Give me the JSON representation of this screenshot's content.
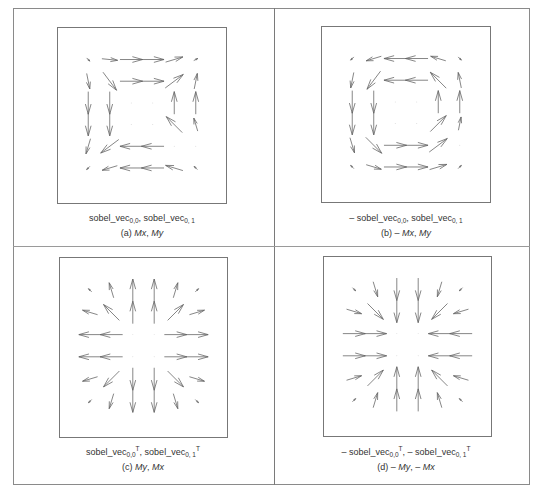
{
  "figure": {
    "panels": [
      {
        "id": "a",
        "box": {
          "left": 57,
          "top": 27,
          "width": 170,
          "height": 177
        },
        "caption": {
          "prefix": "",
          "term1": "sobel_vec",
          "term1_sub": "0,0",
          "term1_sup": "",
          "sep": ", ",
          "term2_prefix": "",
          "term2": "sobel_vec",
          "term2_sub": "0, 1",
          "term2_sup": ""
        },
        "caption_top": 212,
        "label": {
          "tag": "(a)",
          "pre1": "",
          "v1": "Mx",
          "sep": ", ",
          "pre2": "",
          "v2": "My"
        },
        "label_top": 228,
        "center_x": 142,
        "vectors": [
          [
            [
              1,
              1,
              0.2
            ],
            [
              1,
              0.1,
              0.7
            ],
            [
              1,
              0,
              1
            ],
            [
              1,
              0,
              1
            ],
            [
              1,
              -0.3,
              0.8
            ],
            [
              1,
              -0.5,
              0.2
            ]
          ],
          [
            [
              0.2,
              1,
              0.7
            ],
            [
              0.6,
              0.8,
              1
            ],
            [
              1,
              0,
              1
            ],
            [
              1,
              0,
              1
            ],
            [
              0.8,
              -0.6,
              1
            ],
            [
              0.2,
              -1,
              0.7
            ]
          ],
          [
            [
              0,
              1,
              1
            ],
            [
              0,
              1,
              1
            ],
            [
              0,
              0,
              0
            ],
            [
              0,
              0,
              0
            ],
            [
              0,
              -1,
              1
            ],
            [
              0,
              -1,
              1
            ]
          ],
          [
            [
              0,
              1,
              1
            ],
            [
              0,
              1,
              1
            ],
            [
              0,
              0,
              0
            ],
            [
              0,
              0,
              0
            ],
            [
              -0.7,
              -0.7,
              1
            ],
            [
              -0.3,
              -1,
              0.6
            ]
          ],
          [
            [
              -0.3,
              1,
              0.7
            ],
            [
              -0.8,
              0.6,
              1
            ],
            [
              -1,
              0,
              1
            ],
            [
              -1,
              0,
              1
            ],
            [
              -1,
              -0.1,
              0
            ],
            [
              0,
              0,
              0
            ]
          ],
          [
            [
              -0.5,
              0.5,
              0.2
            ],
            [
              -1,
              0.3,
              0.7
            ],
            [
              -1,
              0,
              1
            ],
            [
              -1,
              0,
              1
            ],
            [
              -1,
              -0.3,
              0.8
            ],
            [
              -0.7,
              -0.7,
              0.2
            ]
          ]
        ]
      },
      {
        "id": "b",
        "box": {
          "left": 321,
          "top": 26,
          "width": 170,
          "height": 177
        },
        "caption": {
          "prefix": "– ",
          "term1": "sobel_vec",
          "term1_sub": "0,0",
          "term1_sup": "",
          "sep": ", ",
          "term2_prefix": "",
          "term2": "sobel_vec",
          "term2_sub": "0, 1",
          "term2_sup": ""
        },
        "caption_top": 212,
        "label": {
          "tag": "(b)",
          "pre1": "– ",
          "v1": "Mx",
          "sep": ", ",
          "pre2": "",
          "v2": "My"
        },
        "label_top": 228,
        "center_x": 406,
        "vectors": [
          [
            [
              -1,
              1,
              0.2
            ],
            [
              -1,
              0.3,
              0.7
            ],
            [
              -1,
              0,
              1
            ],
            [
              -1,
              0,
              1
            ],
            [
              -1,
              -0.3,
              0.7
            ],
            [
              0.5,
              0.5,
              0.2
            ]
          ],
          [
            [
              -0.2,
              1,
              0.7
            ],
            [
              -0.6,
              0.8,
              1
            ],
            [
              -1,
              0,
              1
            ],
            [
              -1,
              0,
              1
            ],
            [
              -0.7,
              -0.7,
              1
            ],
            [
              -0.2,
              -1,
              0.7
            ]
          ],
          [
            [
              0,
              1,
              1
            ],
            [
              0,
              1,
              1
            ],
            [
              0,
              0,
              0
            ],
            [
              0,
              0,
              0
            ],
            [
              0,
              -1,
              1
            ],
            [
              0,
              -1,
              1
            ]
          ],
          [
            [
              0,
              1,
              1
            ],
            [
              0,
              1,
              1
            ],
            [
              0,
              0,
              0
            ],
            [
              0,
              0,
              0
            ],
            [
              0.7,
              -0.7,
              1
            ],
            [
              0.2,
              -1,
              0.6
            ]
          ],
          [
            [
              0.3,
              1,
              0.7
            ],
            [
              0.7,
              0.7,
              1
            ],
            [
              1,
              0,
              1
            ],
            [
              1,
              0,
              1
            ],
            [
              0.8,
              -0.6,
              1
            ],
            [
              0,
              0,
              0
            ]
          ],
          [
            [
              -0.5,
              -0.5,
              0.2
            ],
            [
              1,
              0.3,
              0.7
            ],
            [
              1,
              0,
              1
            ],
            [
              1,
              0,
              1
            ],
            [
              1,
              -0.3,
              0.8
            ],
            [
              0.7,
              -0.7,
              0.2
            ]
          ]
        ]
      },
      {
        "id": "c",
        "box": {
          "left": 59,
          "top": 257,
          "width": 169,
          "height": 181
        },
        "caption": {
          "prefix": "",
          "term1": "sobel_vec",
          "term1_sub": "0,0",
          "term1_sup": "T",
          "sep": ", ",
          "term2_prefix": "",
          "term2": "sobel_vec",
          "term2_sub": "0, 1",
          "term2_sup": "T"
        },
        "caption_top": 446,
        "label": {
          "tag": "(c)",
          "pre1": "",
          "v1": "My",
          "sep": ", ",
          "pre2": "",
          "v2": "Mx"
        },
        "label_top": 462,
        "center_x": 143,
        "vectors": [
          [
            [
              -0.7,
              -0.7,
              0.2
            ],
            [
              -0.3,
              -1,
              0.7
            ],
            [
              0,
              -1,
              1
            ],
            [
              0,
              -1,
              1
            ],
            [
              0.3,
              -1,
              0.7
            ],
            [
              0.7,
              -0.7,
              0.2
            ]
          ],
          [
            [
              -1,
              -0.3,
              0.7
            ],
            [
              -0.7,
              -0.7,
              1
            ],
            [
              0,
              -1,
              1
            ],
            [
              0,
              -1,
              1
            ],
            [
              0.7,
              -0.7,
              1
            ],
            [
              1,
              -0.3,
              0.7
            ]
          ],
          [
            [
              -1,
              0,
              1
            ],
            [
              -1,
              0,
              1
            ],
            [
              0,
              0,
              0
            ],
            [
              0,
              0,
              0
            ],
            [
              1,
              0,
              1
            ],
            [
              1,
              0,
              1
            ]
          ],
          [
            [
              -1,
              0,
              1
            ],
            [
              -1,
              0,
              1
            ],
            [
              0,
              0,
              0
            ],
            [
              0,
              0,
              0
            ],
            [
              1,
              0,
              1
            ],
            [
              1,
              0,
              1
            ]
          ],
          [
            [
              -1,
              0.3,
              0.7
            ],
            [
              -0.7,
              0.7,
              1
            ],
            [
              0,
              1,
              1
            ],
            [
              0,
              1,
              1
            ],
            [
              0.7,
              0.7,
              1
            ],
            [
              1,
              0.3,
              0.7
            ]
          ],
          [
            [
              -0.7,
              0.7,
              0.2
            ],
            [
              -0.3,
              1,
              0.7
            ],
            [
              0,
              1,
              1
            ],
            [
              0,
              1,
              1
            ],
            [
              0.3,
              1,
              0.7
            ],
            [
              0.7,
              0.7,
              0.2
            ]
          ]
        ]
      },
      {
        "id": "d",
        "box": {
          "left": 323,
          "top": 256,
          "width": 169,
          "height": 181
        },
        "caption": {
          "prefix": "– ",
          "term1": "sobel_vec",
          "term1_sub": "0,0",
          "term1_sup": "T",
          "sep": ", – ",
          "term2_prefix": "",
          "term2": "sobel_vec",
          "term2_sub": "0, 1",
          "term2_sup": "T"
        },
        "caption_top": 446,
        "label": {
          "tag": "(d)",
          "pre1": "– ",
          "v1": "My",
          "sep": ", ",
          "pre2": "– ",
          "v2": "Mx"
        },
        "label_top": 462,
        "center_x": 406,
        "vectors": [
          [
            [
              0.7,
              0.7,
              0.2
            ],
            [
              0.3,
              1,
              0.7
            ],
            [
              0,
              1,
              1
            ],
            [
              0,
              1,
              1
            ],
            [
              -0.3,
              1,
              0.7
            ],
            [
              -0.7,
              0.7,
              0.2
            ]
          ],
          [
            [
              1,
              0.3,
              0.7
            ],
            [
              0.7,
              0.7,
              1
            ],
            [
              0,
              1,
              1
            ],
            [
              0,
              1,
              1
            ],
            [
              -0.7,
              0.7,
              1
            ],
            [
              -1,
              0.3,
              0.7
            ]
          ],
          [
            [
              1,
              0,
              1
            ],
            [
              1,
              0,
              1
            ],
            [
              0,
              0,
              0
            ],
            [
              0,
              0,
              0
            ],
            [
              -1,
              0,
              1
            ],
            [
              -1,
              0,
              1
            ]
          ],
          [
            [
              1,
              0,
              1
            ],
            [
              1,
              0,
              1
            ],
            [
              0,
              0,
              0
            ],
            [
              0,
              0,
              0
            ],
            [
              -1,
              0,
              1
            ],
            [
              -1,
              0,
              1
            ]
          ],
          [
            [
              1,
              -0.3,
              0.7
            ],
            [
              0.7,
              -0.7,
              1
            ],
            [
              0,
              -1,
              1
            ],
            [
              0,
              -1,
              1
            ],
            [
              -0.7,
              -0.7,
              1
            ],
            [
              -1,
              -0.3,
              0.7
            ]
          ],
          [
            [
              0.7,
              -0.7,
              0.2
            ],
            [
              0.3,
              -1,
              0.7
            ],
            [
              0,
              -1,
              1
            ],
            [
              0,
              -1,
              1
            ],
            [
              -0.3,
              -1,
              0.7
            ],
            [
              -0.7,
              -0.7,
              0.2
            ]
          ]
        ]
      }
    ],
    "arrow_color": "#666666",
    "border_color": "#777777",
    "text_color": "#333333"
  }
}
